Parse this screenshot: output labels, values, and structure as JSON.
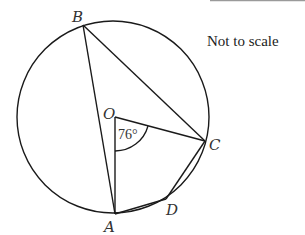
{
  "diagram": {
    "note": "Not to scale",
    "angle_label": "76°",
    "points": {
      "B": {
        "label": "B",
        "x": 83,
        "y": 25
      },
      "O": {
        "label": "O",
        "x": 115,
        "y": 117
      },
      "C": {
        "label": "C",
        "x": 205,
        "y": 141
      },
      "D": {
        "label": "D",
        "x": 166,
        "y": 199
      },
      "A": {
        "label": "A",
        "x": 115,
        "y": 214
      }
    },
    "circle": {
      "cx": 113,
      "cy": 117,
      "r": 96
    },
    "segments": [
      "BA",
      "BC",
      "OA",
      "OC",
      "AD",
      "DC"
    ],
    "colors": {
      "stroke": "#1a1a1a",
      "top_rule": "#9a9a9a"
    }
  }
}
